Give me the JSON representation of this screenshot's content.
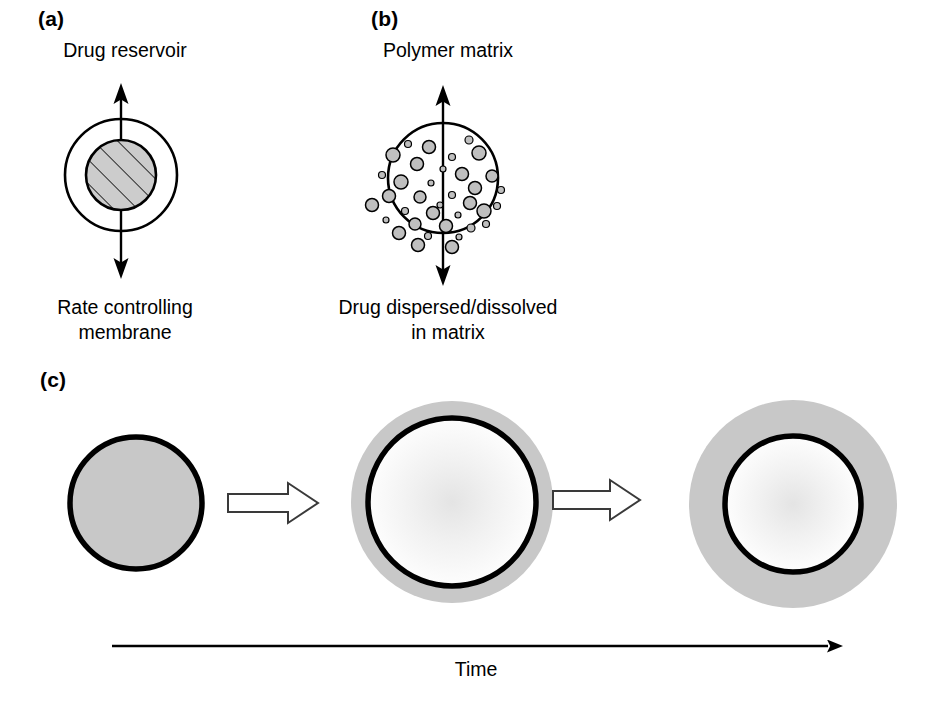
{
  "figure": {
    "background": "#ffffff",
    "width": 932,
    "height": 706
  },
  "colors": {
    "stroke": "#000000",
    "fill_gray": "#c8c8c8",
    "dot_gray": "#bfbfbf",
    "hatch_gray": "#cccccc",
    "text": "#000000",
    "arrow_outline": "#3a3a3a"
  },
  "panels": [
    {
      "id": "a",
      "label": "(a)",
      "label_x": 38,
      "label_y": 8,
      "top_caption": "Drug reservoir",
      "bottom_caption": "Rate controlling\nmembrane",
      "type": "reservoir-system",
      "circle": {
        "cx": 121,
        "cy": 175,
        "outer_r": 56,
        "inner_r": 35,
        "outer_stroke_width": 2.6,
        "inner_stroke_width": 2.6,
        "inner_fill": "#cccccc",
        "hatched": true,
        "hatch_angle_deg": -45,
        "hatch_spacing": 17
      },
      "arrow": {
        "x": 121,
        "top_y": 86,
        "bottom_y": 276,
        "double_headed": true,
        "stroke_width": 2.4
      }
    },
    {
      "id": "b",
      "label": "(b)",
      "label_x": 371,
      "label_y": 8,
      "top_caption": "Polymer matrix",
      "bottom_caption": "Drug dispersed/dissolved\nin matrix",
      "type": "matrix-system",
      "circle": {
        "cx": 443,
        "cy": 178,
        "r": 55,
        "stroke_width": 2.6,
        "fill": "#ffffff"
      },
      "arrow": {
        "x": 443,
        "top_y": 88,
        "bottom_y": 283,
        "double_headed": true,
        "stroke_width": 2.4
      },
      "particle_count": 36,
      "particles": [
        {
          "cx": 429,
          "cy": 147,
          "r": 6.5
        },
        {
          "cx": 469,
          "cy": 140,
          "r": 4.0
        },
        {
          "cx": 408,
          "cy": 144,
          "r": 3.5
        },
        {
          "cx": 393,
          "cy": 155,
          "r": 7.0
        },
        {
          "cx": 452,
          "cy": 157,
          "r": 3.5
        },
        {
          "cx": 479,
          "cy": 153,
          "r": 7.0
        },
        {
          "cx": 417,
          "cy": 164,
          "r": 6.5
        },
        {
          "cx": 443,
          "cy": 169,
          "r": 3.0
        },
        {
          "cx": 382,
          "cy": 175,
          "r": 3.5
        },
        {
          "cx": 462,
          "cy": 174,
          "r": 6.5
        },
        {
          "cx": 492,
          "cy": 176,
          "r": 6.0
        },
        {
          "cx": 401,
          "cy": 182,
          "r": 7.0
        },
        {
          "cx": 431,
          "cy": 183,
          "r": 3.0
        },
        {
          "cx": 475,
          "cy": 188,
          "r": 6.5
        },
        {
          "cx": 501,
          "cy": 190,
          "r": 3.5
        },
        {
          "cx": 389,
          "cy": 196,
          "r": 6.5
        },
        {
          "cx": 420,
          "cy": 197,
          "r": 6.0
        },
        {
          "cx": 452,
          "cy": 195,
          "r": 3.5
        },
        {
          "cx": 440,
          "cy": 205,
          "r": 3.0
        },
        {
          "cx": 470,
          "cy": 203,
          "r": 6.5
        },
        {
          "cx": 497,
          "cy": 206,
          "r": 3.5
        },
        {
          "cx": 372,
          "cy": 205,
          "r": 6.5
        },
        {
          "cx": 405,
          "cy": 211,
          "r": 3.5
        },
        {
          "cx": 433,
          "cy": 213,
          "r": 6.5
        },
        {
          "cx": 458,
          "cy": 215,
          "r": 3.0
        },
        {
          "cx": 484,
          "cy": 211,
          "r": 7.0
        },
        {
          "cx": 386,
          "cy": 220,
          "r": 3.0
        },
        {
          "cx": 415,
          "cy": 224,
          "r": 6.0
        },
        {
          "cx": 446,
          "cy": 226,
          "r": 6.5
        },
        {
          "cx": 471,
          "cy": 228,
          "r": 4.0
        },
        {
          "cx": 399,
          "cy": 233,
          "r": 6.5
        },
        {
          "cx": 428,
          "cy": 236,
          "r": 3.5
        },
        {
          "cx": 459,
          "cy": 237,
          "r": 3.0
        },
        {
          "cx": 486,
          "cy": 224,
          "r": 3.5
        },
        {
          "cx": 418,
          "cy": 245,
          "r": 6.5
        },
        {
          "cx": 452,
          "cy": 247,
          "r": 6.5
        }
      ]
    },
    {
      "id": "c",
      "label": "(c)",
      "label_x": 40,
      "label_y": 369,
      "type": "erosion-sequence",
      "stages": [
        {
          "name": "stage-1-solid-core",
          "cx": 136,
          "cy": 503,
          "gray_r": 0,
          "black_r": 66,
          "black_stroke_width": 5.5,
          "core_fill": "#c8c8c8",
          "has_gray_ring": false,
          "has_white_core": false
        },
        {
          "name": "stage-2-partial-erosion",
          "cx": 452,
          "cy": 502,
          "gray_r": 101,
          "black_r": 84,
          "black_stroke_width": 5.5,
          "core_fill": "#ffffff",
          "has_gray_ring": true,
          "has_white_core": true
        },
        {
          "name": "stage-3-advanced-erosion",
          "cx": 793,
          "cy": 504,
          "gray_r": 104,
          "black_r": 68,
          "black_stroke_width": 5.5,
          "core_fill": "#ffffff",
          "has_gray_ring": true,
          "has_white_core": true
        }
      ],
      "block_arrows": [
        {
          "name": "transition-arrow-1",
          "x1": 228,
          "x2": 318,
          "cy": 503,
          "shaft_half_h": 9,
          "head_half_h": 20,
          "head_len": 30
        },
        {
          "name": "transition-arrow-2",
          "x1": 553,
          "x2": 640,
          "cy": 500,
          "shaft_half_h": 9,
          "head_half_h": 20,
          "head_len": 30
        }
      ],
      "time_axis": {
        "label": "Time",
        "x1": 112,
        "x2": 840,
        "y": 646,
        "stroke_width": 2.6,
        "label_x": 476,
        "label_y": 658
      }
    }
  ]
}
